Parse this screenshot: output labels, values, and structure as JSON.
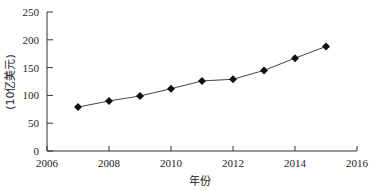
{
  "chart_data": {
    "type": "line",
    "title": "",
    "xlabel": "年份",
    "ylabel": "(10亿美元)",
    "x": [
      2007,
      2008,
      2009,
      2010,
      2011,
      2012,
      2013,
      2014,
      2015
    ],
    "series": [
      {
        "name": "",
        "values": [
          79,
          90,
          99,
          112,
          126,
          129,
          145,
          167,
          188
        ],
        "marker": "diamond",
        "color": "#111111"
      }
    ],
    "xlim": [
      2006,
      2016
    ],
    "ylim": [
      0,
      250
    ],
    "xticks": [
      2006,
      2008,
      2010,
      2012,
      2014,
      2016
    ],
    "yticks": [
      0,
      50,
      100,
      150,
      200,
      250
    ],
    "grid": false,
    "legend": "none"
  }
}
